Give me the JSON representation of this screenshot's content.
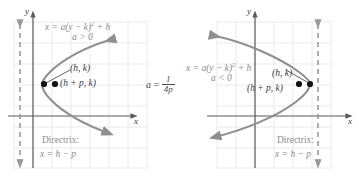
{
  "figure": {
    "colors": {
      "background": "#ffffff",
      "grid": "#e2e2e6",
      "axis": "#5a5a5a",
      "curve": "#8f8f93",
      "directrix": "#9a9a9e",
      "label_gray": "#8c8c8c",
      "label_dark": "#3a3a3a",
      "point": "#1a1a1a"
    },
    "center_formula": {
      "lhs": "a",
      "equals": "=",
      "numerator": "1",
      "denominator": "4p"
    },
    "panels": [
      {
        "id": "left-panel",
        "equation": "x = a(y − k)",
        "equation_exponent": "2",
        "equation_tail": " + h",
        "condition": "a > 0",
        "vertex_label": "(h, k)",
        "focus_label": "(h + p, k)",
        "directrix_title": "Directrix:",
        "directrix_equation": "x = h − p",
        "axis_x_label": "x",
        "axis_y_label": "y",
        "opens": "right",
        "directrix_side": "left"
      },
      {
        "id": "right-panel",
        "equation": "x = a(y − k)",
        "equation_exponent": "2",
        "equation_tail": " + h",
        "condition": "a < 0",
        "vertex_label": "(h, k)",
        "focus_label": "(h + p, k)",
        "directrix_title": "Directrix:",
        "directrix_equation": "x = h − p",
        "axis_x_label": "x",
        "axis_y_label": "y",
        "opens": "left",
        "directrix_side": "right"
      }
    ]
  }
}
